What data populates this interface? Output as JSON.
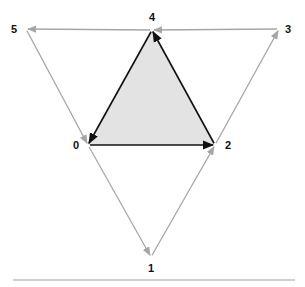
{
  "diagram": {
    "type": "directed-graph",
    "colors": {
      "inner_edge": "#111111",
      "outer_edge": "#a6a6a6",
      "inner_fill": "#e3e3e3",
      "separator": "#cfcfcf",
      "label": "#111111"
    },
    "nodes": [
      {
        "id": "0",
        "label": "0",
        "x": 88,
        "y": 145,
        "label_x": 76,
        "label_y": 149
      },
      {
        "id": "1",
        "label": "1",
        "x": 151,
        "y": 257,
        "label_x": 151,
        "label_y": 272
      },
      {
        "id": "2",
        "label": "2",
        "x": 215,
        "y": 145,
        "label_x": 228,
        "label_y": 149
      },
      {
        "id": "3",
        "label": "3",
        "x": 279,
        "y": 29,
        "label_x": 288,
        "label_y": 33
      },
      {
        "id": "4",
        "label": "4",
        "x": 152,
        "y": 30,
        "label_x": 152,
        "label_y": 21
      },
      {
        "id": "5",
        "label": "5",
        "x": 26,
        "y": 29,
        "label_x": 14,
        "label_y": 33
      }
    ],
    "edges": [
      {
        "from": "0",
        "to": "2",
        "style": "inner"
      },
      {
        "from": "2",
        "to": "4",
        "style": "inner"
      },
      {
        "from": "4",
        "to": "0",
        "style": "inner"
      },
      {
        "from": "0",
        "to": "1",
        "style": "outer"
      },
      {
        "from": "1",
        "to": "2",
        "style": "outer"
      },
      {
        "from": "2",
        "to": "3",
        "style": "outer"
      },
      {
        "from": "3",
        "to": "4",
        "style": "outer"
      },
      {
        "from": "4",
        "to": "5",
        "style": "outer"
      },
      {
        "from": "5",
        "to": "0",
        "style": "outer"
      }
    ],
    "shaded_region": [
      "0",
      "2",
      "4"
    ]
  }
}
